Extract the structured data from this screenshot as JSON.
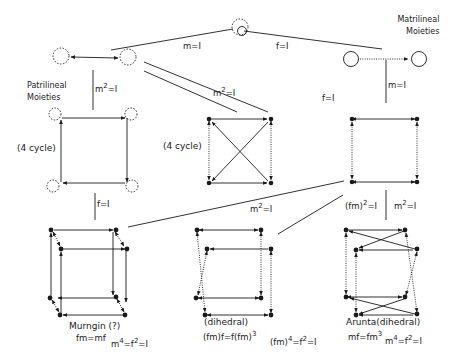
{
  "titles": {
    "patrilineal": [
      "Patrilineal",
      "Moieties"
    ],
    "matrilineal": [
      "Matrilineal",
      "Moieties"
    ]
  },
  "edge_labels": {
    "top_m": "m=I",
    "top_f": "f=I",
    "left_m2_base": "m",
    "left_m2_exp": "2",
    "left_m2_rest": "=I",
    "right_m": "m=I",
    "mid_m2_base": "m",
    "mid_m2_exp": "2",
    "mid_m2_rest": "=I",
    "mid_f": "f=I",
    "left_f": "f=I",
    "low_m2_base": "m",
    "low_m2_exp": "2",
    "low_m2_rest": "=I",
    "fm2_base": "(fm)",
    "fm2_exp": "2",
    "fm2_rest": "=I",
    "right_m2_base": "m",
    "right_m2_exp": "2",
    "right_m2_rest": "=I"
  },
  "node_labels": {
    "cycle_left": "(4 cycle)",
    "cycle_mid": "(4 cycle)"
  },
  "cube_labels": {
    "murngin": {
      "name": "Murngin (?)",
      "rel": "fm=mf",
      "eq_a": "m",
      "eq_a_exp": "4",
      "eq_b": "=f",
      "eq_b_exp": "2",
      "eq_c": "=I"
    },
    "dihedral_mid": {
      "name": "(dihedral)",
      "rel_a": "(fm)f=f(fm)",
      "rel_a_exp": "3",
      "eq_a": "(fm)",
      "eq_a_exp": "4",
      "eq_b": "=f",
      "eq_b_exp": "2",
      "eq_c": "=I"
    },
    "arunta": {
      "name": "Arunta(dihedral)",
      "rel_a": "mf=fm",
      "rel_a_exp": "3",
      "eq_a": "m",
      "eq_a_exp": "4",
      "eq_b": "=f",
      "eq_b_exp": "2",
      "eq_c": "=I"
    }
  },
  "style": {
    "ink": "#1a1a1a",
    "background": "#ffffff"
  }
}
